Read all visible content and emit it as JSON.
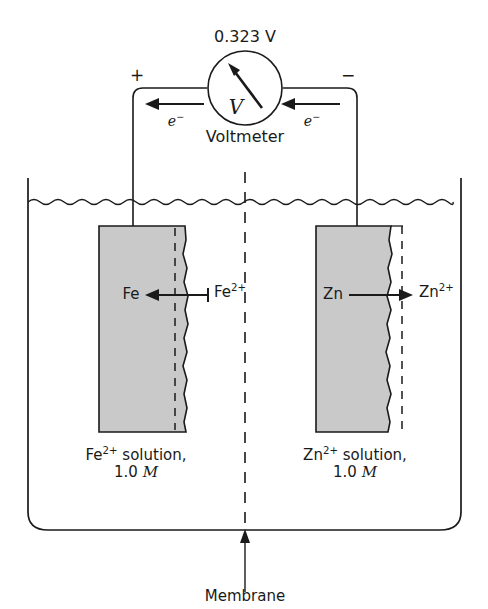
{
  "figure": {
    "type": "galvanic-cell-diagram",
    "title_text": "",
    "voltmeter": {
      "reading": "0.323 V",
      "symbol": "V",
      "caption": "Voltmeter",
      "positive_terminal": "+",
      "negative_terminal": "−"
    },
    "electron_flow": {
      "left_label_base": "e",
      "left_label_sup": "−",
      "right_label_base": "e",
      "right_label_sup": "−",
      "direction": "right-to-left"
    },
    "left_half_cell": {
      "electrode_label": "Fe",
      "ion_label_base": "Fe",
      "ion_label_sup": "2+",
      "reaction_arrow_direction": "left",
      "solution_name_base": "Fe",
      "solution_name_sup": "2+",
      "solution_name_rest": " solution,",
      "concentration_value": "1.0",
      "concentration_unit": "M"
    },
    "right_half_cell": {
      "electrode_label": "Zn",
      "ion_label_base": "Zn",
      "ion_label_sup": "2+",
      "reaction_arrow_direction": "right",
      "solution_name_base": "Zn",
      "solution_name_sup": "2+",
      "solution_name_rest": " solution,",
      "concentration_value": "1.0",
      "concentration_unit": "M"
    },
    "membrane": {
      "label": "Membrane",
      "style": "dashed-vertical-line"
    },
    "colors": {
      "electrode_fill": "#c9c9c9",
      "stroke": "#1a1a1a",
      "background": "#ffffff"
    }
  }
}
